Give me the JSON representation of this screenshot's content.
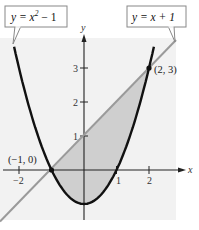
{
  "chart_data": {
    "type": "line",
    "title": "",
    "xlabel": "x",
    "ylabel": "y",
    "xlim": [
      -2.6,
      2.9
    ],
    "ylim": [
      -1.5,
      3.8
    ],
    "grid": false,
    "x_ticks": [
      -2,
      1,
      2
    ],
    "x_tick_labels": [
      "−2",
      "1",
      "2"
    ],
    "y_ticks": [
      1,
      2,
      3
    ],
    "y_tick_labels": [
      "1",
      "2",
      "3"
    ],
    "series": [
      {
        "name": "y = x² − 1",
        "kind": "parabola",
        "color": "#111111",
        "x": [
          -2.4,
          -2,
          -1,
          0,
          1,
          2,
          2.2
        ],
        "y": [
          4.76,
          3,
          0,
          -1,
          0,
          3,
          3.84
        ]
      },
      {
        "name": "y = x + 1",
        "kind": "line",
        "color": "#9a9a9a",
        "x": [
          -2.6,
          -1,
          0,
          2,
          2.9
        ],
        "y": [
          -1.6,
          0,
          1,
          3,
          3.9
        ]
      }
    ],
    "shaded_region": {
      "between": [
        "y = x + 1",
        "y = x² − 1"
      ],
      "x_from": -1,
      "x_to": 2,
      "color": "#cfcfcf"
    },
    "annotations": [
      {
        "text": "(−1, 0)",
        "x": -1,
        "y": 0
      },
      {
        "text": "(2, 3)",
        "x": 2,
        "y": 3
      }
    ],
    "legend": [
      {
        "label": "y = x² − 1",
        "position": "top-left callout"
      },
      {
        "label": "y = x + 1",
        "position": "top-right callout"
      }
    ]
  },
  "labels": {
    "parabola_eq_prefix": "y = x",
    "parabola_eq_exp": "2",
    "parabola_eq_suffix": " − 1",
    "line_eq": "y = x + 1",
    "x_axis": "x",
    "y_axis": "y",
    "tick_x_neg2": "−2",
    "tick_x_1": "1",
    "tick_x_2": "2",
    "tick_y_1": "1",
    "tick_y_2": "2",
    "tick_y_3": "3",
    "point_left": "(−1, 0)",
    "point_right": "(2, 3)"
  },
  "colors": {
    "background": "#ffffff",
    "plot_area": "#f2f2f2",
    "shade": "#cfcfcf",
    "parabola": "#111111",
    "line": "#9a9a9a",
    "axes": "#222222"
  }
}
